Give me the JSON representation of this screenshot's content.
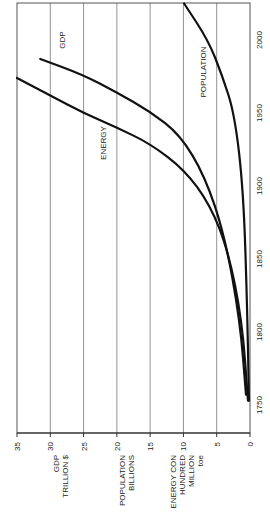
{
  "chart_data": {
    "type": "line",
    "orientation": "rotated-90-clockwise",
    "title": "",
    "xlabel": "Year",
    "ylabel": "",
    "x_ticks": [
      1750,
      1800,
      1850,
      1900,
      1950,
      2000
    ],
    "y_ticks": [
      0,
      5,
      10,
      15,
      20,
      25,
      30,
      35
    ],
    "ylim": [
      0,
      35
    ],
    "xlim": [
      1745,
      2025
    ],
    "grid": "vertical lines at each y tick",
    "legend": "none (inline labels)",
    "axis_titles": [
      {
        "lines": [
          "GDP",
          "TRILLION $"
        ],
        "at_value": 28.5
      },
      {
        "lines": [
          "POPULATION",
          "BILLIONS"
        ],
        "at_value": 18.5
      },
      {
        "lines": [
          "ENERGY CON",
          "HUNDRED",
          "MILLION",
          "toe"
        ],
        "at_value": 9.5
      }
    ],
    "series": [
      {
        "name": "GDP",
        "label": "GDP",
        "points": [
          [
            1757,
            0.6
          ],
          [
            1808,
            1.5
          ],
          [
            1866,
            3.8
          ],
          [
            1907,
            6.8
          ],
          [
            1935,
            10.5
          ],
          [
            1951,
            15
          ],
          [
            1964,
            20
          ],
          [
            1976,
            25
          ],
          [
            1987,
            31.5
          ]
        ]
      },
      {
        "name": "ENERGY",
        "label": "ENERGY",
        "points": [
          [
            1753,
            0.3
          ],
          [
            1808,
            1.2
          ],
          [
            1856,
            3.3
          ],
          [
            1887,
            6
          ],
          [
            1911,
            9.8
          ],
          [
            1929,
            15
          ],
          [
            1940,
            20
          ],
          [
            1950,
            25
          ],
          [
            1962,
            30
          ],
          [
            1974,
            35
          ]
        ]
      },
      {
        "name": "POPULATION",
        "label": "POPULATION",
        "points": [
          [
            1753,
            0.15
          ],
          [
            1822,
            0.45
          ],
          [
            1897,
            1
          ],
          [
            1949,
            2.3
          ],
          [
            1976,
            4.2
          ],
          [
            2000,
            6.3
          ],
          [
            2025,
            9.9
          ]
        ]
      }
    ]
  },
  "labels": {
    "series": {
      "gdp": "GDP",
      "energy": "ENERGY",
      "population": "POPULATION"
    }
  }
}
